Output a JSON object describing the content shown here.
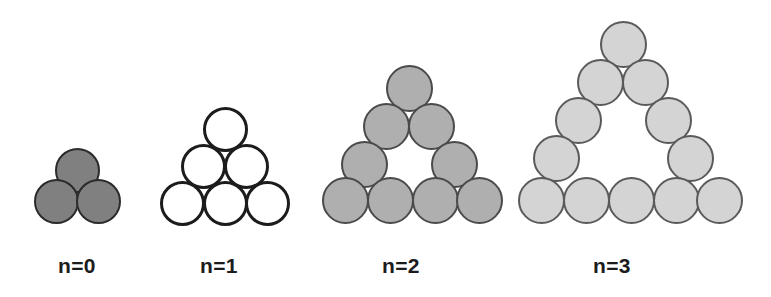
{
  "figure": {
    "background_color": "#ffffff",
    "canvas": {
      "width": 771,
      "height": 297
    },
    "groups": [
      {
        "id": "group-n0",
        "label": "n=0",
        "label_x": 58,
        "label_y": 255,
        "fill": "#808080",
        "stroke": "#2b2b2b",
        "stroke_width": 2,
        "diameter": 45,
        "circle_count": 3,
        "rows": [
          1,
          2
        ],
        "hollow": false,
        "circles": [
          {
            "cx": 77,
            "cy": 170
          },
          {
            "cx": 56,
            "cy": 201
          },
          {
            "cx": 98,
            "cy": 201
          }
        ]
      },
      {
        "id": "group-n1",
        "label": "n=1",
        "label_x": 200,
        "label_y": 255,
        "fill": "#ffffff",
        "stroke": "#1c1c1c",
        "stroke_width": 3,
        "diameter": 45,
        "circle_count": 6,
        "rows": [
          1,
          2,
          3
        ],
        "hollow": false,
        "circles": [
          {
            "cx": 225,
            "cy": 129
          },
          {
            "cx": 203,
            "cy": 166
          },
          {
            "cx": 246,
            "cy": 166
          },
          {
            "cx": 182,
            "cy": 203
          },
          {
            "cx": 225,
            "cy": 203
          },
          {
            "cx": 267,
            "cy": 203
          }
        ]
      },
      {
        "id": "group-n2",
        "label": "n=2",
        "label_x": 382,
        "label_y": 255,
        "fill": "#afafaf",
        "stroke": "#4a4a4a",
        "stroke_width": 2,
        "diameter": 47,
        "circle_count": 9,
        "rows": [
          1,
          2,
          2,
          4
        ],
        "hollow": true,
        "circles": [
          {
            "cx": 409,
            "cy": 88
          },
          {
            "cx": 386,
            "cy": 126
          },
          {
            "cx": 431,
            "cy": 126
          },
          {
            "cx": 364,
            "cy": 164
          },
          {
            "cx": 454,
            "cy": 164
          },
          {
            "cx": 345,
            "cy": 200
          },
          {
            "cx": 390,
            "cy": 200
          },
          {
            "cx": 435,
            "cy": 200
          },
          {
            "cx": 479,
            "cy": 200
          }
        ]
      },
      {
        "id": "group-n3",
        "label": "n=3",
        "label_x": 593,
        "label_y": 255,
        "fill": "#d4d4d4",
        "stroke": "#5a5a5a",
        "stroke_width": 2,
        "diameter": 47,
        "circle_count": 12,
        "rows": [
          1,
          2,
          2,
          2,
          5
        ],
        "hollow": true,
        "circles": [
          {
            "cx": 623,
            "cy": 44
          },
          {
            "cx": 600,
            "cy": 82
          },
          {
            "cx": 645,
            "cy": 82
          },
          {
            "cx": 578,
            "cy": 120
          },
          {
            "cx": 668,
            "cy": 120
          },
          {
            "cx": 556,
            "cy": 158
          },
          {
            "cx": 690,
            "cy": 158
          },
          {
            "cx": 541,
            "cy": 200
          },
          {
            "cx": 586,
            "cy": 200
          },
          {
            "cx": 631,
            "cy": 200
          },
          {
            "cx": 676,
            "cy": 200
          },
          {
            "cx": 719,
            "cy": 200
          }
        ]
      }
    ]
  }
}
